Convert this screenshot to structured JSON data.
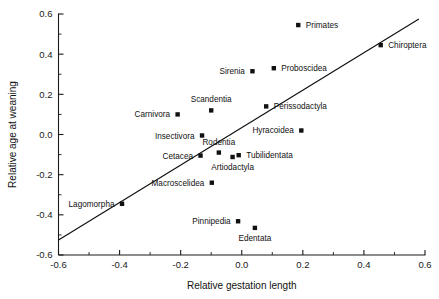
{
  "chart_data": {
    "type": "scatter",
    "title": "",
    "xlabel": "Relative gestation length",
    "ylabel": "Relative age at weaning",
    "xlim": [
      -0.6,
      0.6
    ],
    "ylim": [
      -0.6,
      0.6
    ],
    "xticks": [
      "-0.6",
      "-0.4",
      "-0.2",
      "0.0",
      "0.2",
      "0.4",
      "0.6"
    ],
    "xtick_values": [
      -0.6,
      -0.4,
      -0.2,
      0.0,
      0.2,
      0.4,
      0.6
    ],
    "yticks": [
      "0.6",
      "0.4",
      "0.2",
      "0.0",
      "-0.2",
      "-0.4",
      "-0.6"
    ],
    "ytick_values": [
      0.6,
      0.4,
      0.2,
      0.0,
      -0.2,
      -0.4,
      -0.6
    ],
    "minor_ticks_per_interval": 1,
    "grid": false,
    "legend": "none",
    "marker": "square",
    "marker_color": "#111111",
    "line_color": "#111111",
    "trendline": {
      "label": "regression line",
      "x0": -0.6,
      "y0": -0.525,
      "x1": 0.58,
      "y1": 0.575
    },
    "points": [
      {
        "label": "Primates",
        "x": 0.185,
        "y": 0.545,
        "label_pos": "right"
      },
      {
        "label": "Chiroptera",
        "x": 0.455,
        "y": 0.445,
        "label_pos": "right"
      },
      {
        "label": "Sirenia",
        "x": 0.035,
        "y": 0.315,
        "label_pos": "left"
      },
      {
        "label": "Proboscidea",
        "x": 0.105,
        "y": 0.33,
        "label_pos": "right"
      },
      {
        "label": "Scandentia",
        "x": -0.1,
        "y": 0.12,
        "label_pos": "above"
      },
      {
        "label": "Carnivora",
        "x": -0.21,
        "y": 0.1,
        "label_pos": "left"
      },
      {
        "label": "Perissodactyla",
        "x": 0.08,
        "y": 0.14,
        "label_pos": "right"
      },
      {
        "label": "Insectivora",
        "x": -0.13,
        "y": -0.005,
        "label_pos": "left"
      },
      {
        "label": "Hyracoidea",
        "x": 0.195,
        "y": 0.02,
        "label_pos": "left"
      },
      {
        "label": "Rodentia",
        "x": -0.075,
        "y": -0.09,
        "label_pos": "above"
      },
      {
        "label": "Cetacea",
        "x": -0.135,
        "y": -0.105,
        "label_pos": "left"
      },
      {
        "label": "Artiodactyla",
        "x": -0.03,
        "y": -0.112,
        "label_pos": "below"
      },
      {
        "label": "Tubilidentata",
        "x": -0.01,
        "y": -0.103,
        "label_pos": "right"
      },
      {
        "label": "Macroscelidea",
        "x": -0.098,
        "y": -0.24,
        "label_pos": "left"
      },
      {
        "label": "Lagomorpha",
        "x": -0.392,
        "y": -0.345,
        "label_pos": "left"
      },
      {
        "label": "Pinnipedia",
        "x": -0.012,
        "y": -0.432,
        "label_pos": "left"
      },
      {
        "label": "Edentata",
        "x": 0.043,
        "y": -0.465,
        "label_pos": "below"
      }
    ]
  }
}
